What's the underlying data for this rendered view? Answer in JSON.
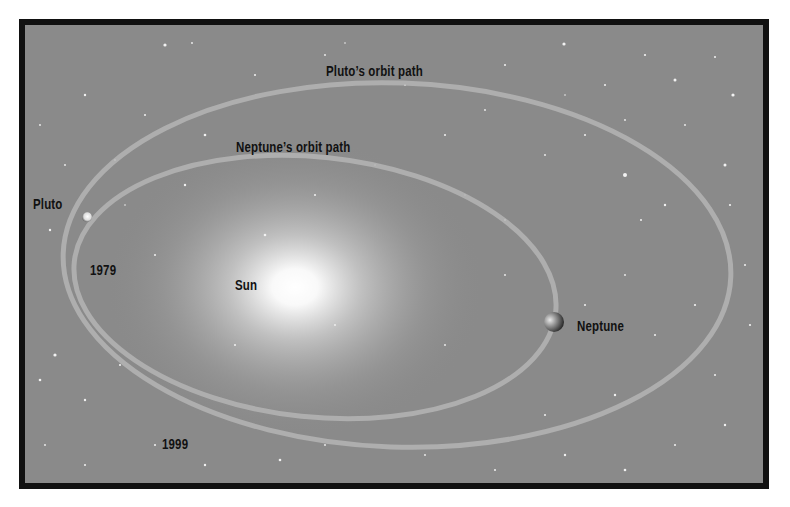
{
  "diagram": {
    "labels": {
      "pluto_orbit": "Pluto’s orbit path",
      "neptune_orbit": "Neptune’s orbit path",
      "pluto": "Pluto",
      "sun": "Sun",
      "neptune": "Neptune",
      "year_1979": "1979",
      "year_1999": "1999"
    },
    "colors": {
      "background": "#8a8a8a",
      "border": "#111111",
      "orbit": "#b4b4b4",
      "sun_glow": "#ffffff",
      "label": "#111111"
    }
  }
}
